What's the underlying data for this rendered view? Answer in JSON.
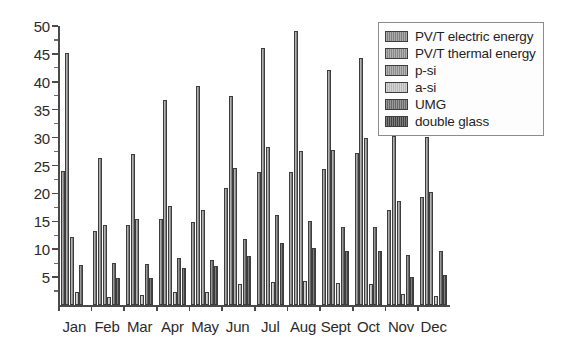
{
  "chart_data": {
    "type": "bar",
    "title": "",
    "subtitle": "",
    "xlabel": "",
    "ylabel": "",
    "grid": false,
    "legend_position": "top-right",
    "categories": [
      "Jan",
      "Feb",
      "Mar",
      "Apr",
      "May",
      "Jun",
      "Jul",
      "Aug",
      "Sept",
      "Oct",
      "Nov",
      "Dec"
    ],
    "ylim": [
      0,
      50
    ],
    "yticks": [
      5,
      10,
      15,
      20,
      25,
      30,
      35,
      40,
      45,
      50
    ],
    "ytick_labels": [
      "5",
      "10",
      "15",
      "20",
      "25",
      "30",
      "35",
      "40",
      "45",
      "50"
    ],
    "minor_ticks": true,
    "series": [
      {
        "name": "PV/T electric energy",
        "color": "#878787",
        "values": [
          24.0,
          13.3,
          14.4,
          15.4,
          14.8,
          20.9,
          23.9,
          23.8,
          24.4,
          27.2,
          17.1,
          19.4
        ]
      },
      {
        "name": "PV/T thermal energy",
        "color": "#8f8f8f",
        "values": [
          45.2,
          26.3,
          27.1,
          36.7,
          39.2,
          37.4,
          46.1,
          49.1,
          42.1,
          44.3,
          30.2,
          30.1
        ]
      },
      {
        "name": "p-si",
        "color": "#949494",
        "values": [
          12.2,
          14.3,
          15.5,
          17.7,
          17.1,
          24.6,
          28.3,
          27.6,
          27.7,
          29.9,
          18.7,
          20.3
        ]
      },
      {
        "name": "a-si",
        "color": "#c2c2c2",
        "values": [
          2.3,
          1.5,
          1.8,
          2.3,
          2.3,
          3.8,
          4.2,
          4.3,
          4.0,
          3.8,
          1.9,
          1.7
        ]
      },
      {
        "name": "UMG",
        "color": "#6e6e6e",
        "values": [
          7.1,
          7.5,
          7.4,
          8.4,
          8.0,
          11.8,
          16.2,
          15.1,
          14.0,
          14.0,
          9.0,
          9.6
        ]
      },
      {
        "name": "double glass",
        "color": "#464646",
        "values": [
          0.0,
          4.9,
          4.9,
          6.7,
          7.0,
          8.8,
          11.1,
          10.3,
          9.6,
          9.6,
          5.1,
          5.3
        ]
      }
    ]
  }
}
